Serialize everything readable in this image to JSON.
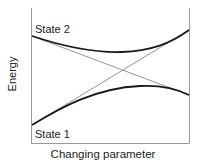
{
  "diagram": {
    "type": "avoided-crossing energy diagram",
    "y_axis_label": "Energy",
    "x_axis_label": "Changing parameter",
    "state_labels": {
      "upper": "State 2",
      "lower": "State 1"
    },
    "curves": [
      {
        "name": "adiabatic-upper",
        "style": "thick",
        "description": "Upper adiabatic curve starting at State 2 (left), dipping then rising to top-right"
      },
      {
        "name": "adiabatic-lower",
        "style": "thick",
        "description": "Lower adiabatic curve starting at State 1 (left), rising then falling to lower-right"
      },
      {
        "name": "diabatic-1",
        "style": "thin",
        "description": "Straight diabatic line from upper-left to lower-right"
      },
      {
        "name": "diabatic-2",
        "style": "thin",
        "description": "Straight diabatic line from lower-left to upper-right"
      }
    ],
    "colors": {
      "axis": "#9a9a9a",
      "thick_curve": "#1a1a1a",
      "thin_line": "#8a8a8a",
      "text": "#222222"
    }
  }
}
